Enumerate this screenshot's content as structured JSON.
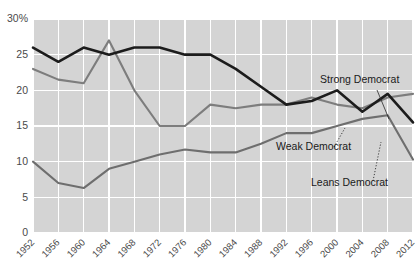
{
  "chart_data": {
    "type": "line",
    "title": "",
    "subtitle": "",
    "xlabel": "",
    "ylabel": "",
    "categories": [
      1952,
      1956,
      1960,
      1964,
      1968,
      1972,
      1976,
      1980,
      1984,
      1988,
      1992,
      1996,
      2000,
      2004,
      2008,
      2012
    ],
    "xtick_labels": [
      "1952",
      "1956",
      "1960",
      "1964",
      "1968",
      "1972",
      "1976",
      "1980",
      "1984",
      "1988",
      "1992",
      "1996",
      "2000",
      "2004",
      "2008",
      "2012"
    ],
    "ytick_labels": [
      "0",
      "5",
      "10",
      "15",
      "20",
      "25",
      "30%"
    ],
    "ytick_values": [
      0,
      5,
      10,
      15,
      20,
      25,
      30
    ],
    "ylim": [
      0,
      30
    ],
    "xlim": [
      1952,
      2012
    ],
    "grid": true,
    "legend_position": "inline-annotations",
    "series": [
      {
        "name": "Weak Democrat",
        "color": "#1c1c1c",
        "values": [
          26.0,
          24.0,
          26.0,
          25.0,
          26.0,
          26.0,
          25.0,
          25.0,
          23.0,
          20.5,
          18.0,
          18.5,
          20.0,
          17.0,
          19.5,
          15.5
        ]
      },
      {
        "name": "Strong Democrat",
        "color": "#7d7d7d",
        "values": [
          23.0,
          21.5,
          21.0,
          27.0,
          20.0,
          15.0,
          15.0,
          18.0,
          17.5,
          18.0,
          18.0,
          19.0,
          18.0,
          17.5,
          19.0,
          19.5
        ]
      },
      {
        "name": "Leans Democrat",
        "color": "#6e6e6e",
        "values": [
          10.0,
          7.0,
          6.3,
          9.0,
          10.0,
          11.0,
          11.7,
          11.3,
          11.3,
          12.5,
          14.0,
          14.0,
          15.0,
          16.0,
          16.5,
          10.3
        ]
      }
    ],
    "annotations": [
      {
        "text": "Strong Democrat",
        "x": 320,
        "y": 83
      },
      {
        "text": "Weak Democrat",
        "x": 276,
        "y": 150
      },
      {
        "text": "Leans Democrat",
        "x": 311,
        "y": 186
      }
    ],
    "colors": {
      "plot_background": "#d4d4d4",
      "gridline": "#ffffff",
      "page_background": "#ffffff",
      "tick_text": "#4a4a4a",
      "annotation_text": "#1a1a1a"
    }
  }
}
